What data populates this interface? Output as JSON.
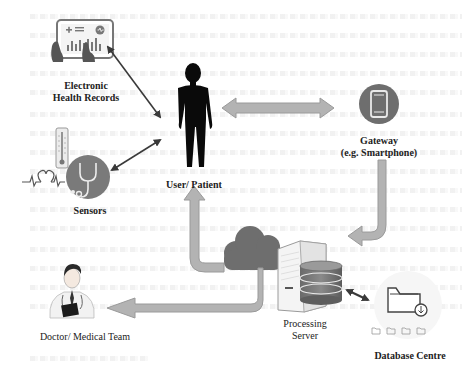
{
  "diagram": {
    "type": "IoT healthcare architecture",
    "nodes": [
      {
        "id": "ehr",
        "label_lines": [
          "Electronic",
          "Health Records"
        ],
        "icon": "tablet-chart-icon"
      },
      {
        "id": "user",
        "label_lines": [
          "User/ Patient"
        ],
        "icon": "human-silhouette-icon"
      },
      {
        "id": "gateway",
        "label_lines": [
          "Gateway",
          "(e.g. Smartphone)"
        ],
        "icon": "smartphone-icon"
      },
      {
        "id": "sensors",
        "label_lines": [
          "Sensors"
        ],
        "icon": "stethoscope-icon"
      },
      {
        "id": "server",
        "label_lines": [
          "Processing",
          "Server"
        ],
        "icon": "server-database-icon"
      },
      {
        "id": "cloud",
        "label_lines": [],
        "icon": "cloud-icon"
      },
      {
        "id": "database",
        "label_lines": [
          "Database Centre"
        ],
        "icon": "folder-download-icon"
      },
      {
        "id": "doctor",
        "label_lines": [
          "Doctor/ Medical Team"
        ],
        "icon": "doctor-icon"
      }
    ],
    "edges": [
      {
        "from": "ehr",
        "to": "user",
        "style": "thin-double-arrow"
      },
      {
        "from": "sensors",
        "to": "user",
        "style": "thin-double-arrow"
      },
      {
        "from": "user",
        "to": "gateway",
        "style": "wide-double-arrow"
      },
      {
        "from": "gateway",
        "to": "server",
        "style": "wide-bent-arrow"
      },
      {
        "from": "cloud",
        "to": "user",
        "style": "wide-bent-arrow"
      },
      {
        "from": "cloud",
        "to": "doctor",
        "style": "wide-bent-arrow"
      },
      {
        "from": "server",
        "to": "database",
        "style": "thin-double-arrow"
      }
    ]
  },
  "labels": {
    "ehr_1": "Electronic",
    "ehr_2": "Health Records",
    "user": "User/ Patient",
    "gateway_1": "Gateway",
    "gateway_2": "(e.g. Smartphone)",
    "sensors": "Sensors",
    "server_1": "Processing",
    "server_2": "Server",
    "database": "Database Centre",
    "doctor": "Doctor/ Medical Team"
  },
  "colors": {
    "arrow_fill": "#b3b3b3",
    "arrow_stroke": "#8c8c8c",
    "icon_dark": "#5a5a5a",
    "circle_fill": "#6e6e6e",
    "silhouette": "#0a0a0a"
  }
}
